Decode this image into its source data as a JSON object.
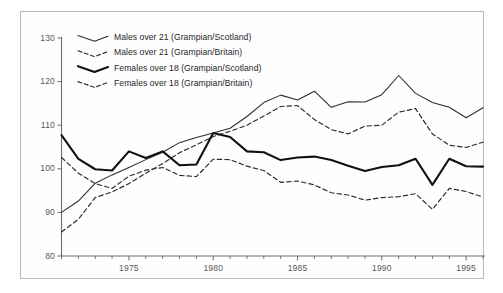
{
  "chart_data": {
    "type": "line",
    "title": "",
    "subtitle": "",
    "xlabel": "",
    "ylabel": "",
    "xlim": [
      1971,
      1996
    ],
    "ylim": [
      80,
      130
    ],
    "grid": false,
    "legend_position": "top-left",
    "y_ticks": [
      "80",
      "90",
      "100",
      "110",
      "120",
      "130"
    ],
    "y_tick_values": [
      80,
      90,
      100,
      110,
      120,
      130
    ],
    "x_ticks": [
      "1975",
      "1980",
      "1985",
      "1990",
      "1995"
    ],
    "x_tick_values": [
      1975,
      1980,
      1985,
      1990,
      1995
    ],
    "x_minor_tick_values": [
      1971,
      1972,
      1973,
      1974,
      1976,
      1977,
      1978,
      1979,
      1981,
      1982,
      1983,
      1984,
      1986,
      1987,
      1988,
      1989,
      1991,
      1992,
      1993,
      1994,
      1996
    ],
    "x": [
      1971,
      1972,
      1973,
      1974,
      1975,
      1976,
      1977,
      1978,
      1979,
      1980,
      1981,
      1982,
      1983,
      1984,
      1985,
      1986,
      1987,
      1988,
      1989,
      1990,
      1991,
      1992,
      1993,
      1994,
      1995,
      1996
    ],
    "series": [
      {
        "name": "Males over 21 (Grampian/Scotland)",
        "style": "solid-thin",
        "color": "#2b2b2b",
        "values": [
          90.0,
          92.6,
          96.7,
          98.6,
          100.3,
          102.1,
          103.8,
          106.0,
          107.2,
          108.2,
          109.3,
          112.0,
          115.2,
          116.9,
          115.8,
          117.8,
          114.1,
          115.4,
          115.3,
          117.0,
          121.4,
          117.3,
          115.2,
          114.1,
          111.7,
          114.0
        ]
      },
      {
        "name": "Males over 21 (Grampian/Britain)",
        "style": "dashed-thin",
        "color": "#2b2b2b",
        "values": [
          85.5,
          88.4,
          93.4,
          94.7,
          96.6,
          99.0,
          101.2,
          103.7,
          105.5,
          107.4,
          108.6,
          110.0,
          112.1,
          114.3,
          114.5,
          111.3,
          109.0,
          108.0,
          109.8,
          110.0,
          113.0,
          113.8,
          108.0,
          105.4,
          104.9,
          106.1
        ]
      },
      {
        "name": "Females over 18 (Grampian/Scotland)",
        "style": "solid-thick",
        "color": "#111111",
        "values": [
          107.7,
          102.3,
          99.9,
          99.6,
          104.0,
          102.5,
          104.0,
          100.8,
          101.0,
          108.2,
          107.3,
          104.0,
          103.8,
          102.0,
          102.6,
          102.8,
          102.0,
          100.7,
          99.5,
          100.4,
          100.8,
          102.3,
          96.3,
          102.3,
          100.6,
          100.5
        ]
      },
      {
        "name": "Females over 18 (Grampian/Britain)",
        "style": "dashed-thin",
        "color": "#2b2b2b",
        "values": [
          102.6,
          99.0,
          96.6,
          95.5,
          98.3,
          99.7,
          100.3,
          98.5,
          98.2,
          102.2,
          102.1,
          100.6,
          99.6,
          96.9,
          97.2,
          96.3,
          94.5,
          94.0,
          92.8,
          93.4,
          93.6,
          94.3,
          90.7,
          95.5,
          94.8,
          93.5
        ]
      }
    ]
  },
  "legend": {
    "items": [
      {
        "label": "Males over 21 (Grampian/Scotland)",
        "style": "solid-thin"
      },
      {
        "label": "Males over 21 (Grampian/Britain)",
        "style": "dashed-thin"
      },
      {
        "label": "Females over 18 (Grampian/Scotland)",
        "style": "solid-thick"
      },
      {
        "label": "Females over 18 (Grampian/Britain)",
        "style": "dashed-thin"
      }
    ]
  },
  "colors": {
    "frame_border": "#b9b9b9",
    "axis": "#6d6d6d",
    "tick_label": "#58585a",
    "line_thin": "#2b2b2b",
    "line_thick": "#111111",
    "background": "#ffffff"
  }
}
